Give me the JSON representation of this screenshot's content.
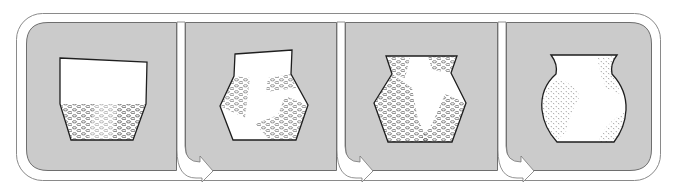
{
  "diagram": {
    "title": "Sequence of vessel forms",
    "colors": {
      "background": "#ffffff",
      "panel_fill": "#cbcbcb",
      "panel_stroke": "#6e6e6e",
      "outer_line": "#8a8a8a",
      "vessel_fill": "#ffffff",
      "vessel_stroke": "#1e1e1e",
      "texture": "#4a4a4a"
    },
    "panels": [
      {
        "index": 1,
        "vessel_shape": "straight-walled pot with tapered lower body",
        "texture": "scattered pebble pattern on lower body"
      },
      {
        "index": 2,
        "vessel_shape": "carinated jar with flared rim",
        "texture": "pebble patches on shoulder and lower body"
      },
      {
        "index": 3,
        "vessel_shape": "carinated jar with constricted neck",
        "texture": "dense pebble pattern over most of the body"
      },
      {
        "index": 4,
        "vessel_shape": "rounded globular jar",
        "texture": "fine dotted stipple patches"
      }
    ],
    "arrows": [
      {
        "from": 1,
        "to": 2,
        "icon": "curved-arrow-right"
      },
      {
        "from": 2,
        "to": 3,
        "icon": "curved-arrow-right"
      },
      {
        "from": 3,
        "to": 4,
        "icon": "curved-arrow-right"
      }
    ]
  }
}
